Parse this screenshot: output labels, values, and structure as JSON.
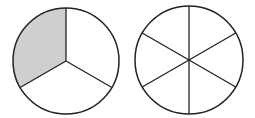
{
  "diagram": {
    "colors": {
      "stroke": "#222222",
      "shade": "#cfcfcf",
      "background": "#ffffff"
    },
    "circles": [
      {
        "name": "thirds",
        "cx": 66,
        "cy": 61,
        "r": 53,
        "parts": 3,
        "shaded": 1,
        "start_angle_deg": -90
      },
      {
        "name": "sixths",
        "cx": 189,
        "cy": 60,
        "r": 54,
        "parts": 6,
        "shaded": 0,
        "start_angle_deg": -90
      }
    ]
  }
}
